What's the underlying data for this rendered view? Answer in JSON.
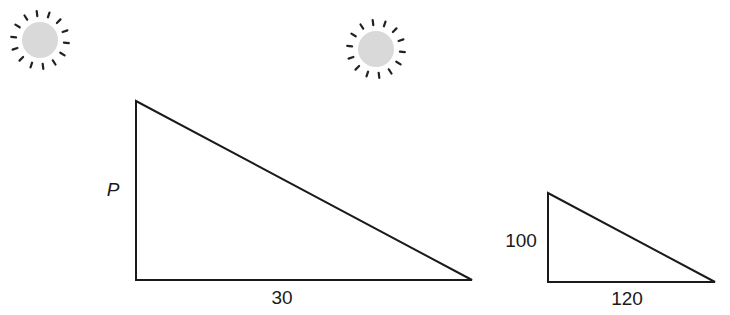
{
  "diagram": {
    "suns": [
      {
        "id": "sun-left",
        "cx": 40,
        "cy": 40,
        "r": 18,
        "ray_count": 14
      },
      {
        "id": "sun-center",
        "cx": 376,
        "cy": 49,
        "r": 18,
        "ray_count": 14
      }
    ],
    "colors": {
      "sun_fill": "#d9d9d9",
      "sun_rays": "#222222",
      "stroke": "#1a1a1a"
    },
    "triangles": [
      {
        "id": "large-triangle",
        "points": {
          "apex": [
            136,
            101
          ],
          "right_angle": [
            136,
            280
          ],
          "base_end": [
            472,
            280
          ]
        },
        "labels": {
          "height": "P",
          "base": "30"
        }
      },
      {
        "id": "small-triangle",
        "points": {
          "apex": [
            548,
            193
          ],
          "right_angle": [
            548,
            282
          ],
          "base_end": [
            715,
            282
          ]
        },
        "labels": {
          "height": "100",
          "base": "120"
        }
      }
    ]
  }
}
